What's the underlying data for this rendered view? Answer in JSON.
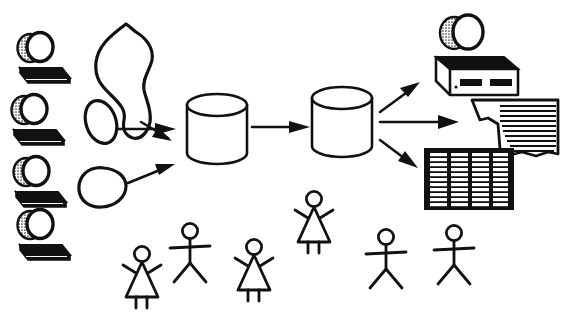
{
  "diagram": {
    "style": "hand-drawn black ink clipart on white",
    "colors": {
      "ink": "#111111",
      "paper": "#ffffff",
      "shade": "#5a5a5a"
    },
    "canvas": {
      "width": 564,
      "height": 315
    },
    "sources": [
      {
        "name": "workstation-1",
        "icon": "computer-icon",
        "x": 18,
        "y": 28
      },
      {
        "name": "workstation-2",
        "icon": "computer-icon",
        "x": 12,
        "y": 90
      },
      {
        "name": "workstation-3",
        "icon": "computer-icon",
        "x": 14,
        "y": 152
      },
      {
        "name": "workstation-4",
        "icon": "computer-icon",
        "x": 18,
        "y": 205
      }
    ],
    "blobs": [
      {
        "name": "blob-irregular",
        "shape": "irregular-cloud",
        "x": 95,
        "y": 30
      },
      {
        "name": "blob-ellipse",
        "shape": "tilted-ellipse",
        "x": 80,
        "y": 100
      },
      {
        "name": "blob-teardrop",
        "shape": "teardrop",
        "x": 82,
        "y": 160
      }
    ],
    "stores": [
      {
        "name": "database-cylinder-1",
        "icon": "cylinder-icon",
        "x": 185,
        "y": 95
      },
      {
        "name": "database-cylinder-2",
        "icon": "cylinder-icon",
        "x": 310,
        "y": 88
      }
    ],
    "outputs": [
      {
        "name": "printer-output",
        "icon": "printer-icon",
        "x": 430,
        "y": 15
      },
      {
        "name": "report-document-output",
        "icon": "document-icon",
        "x": 470,
        "y": 96
      },
      {
        "name": "spreadsheet-output",
        "icon": "spreadsheet-icon",
        "x": 424,
        "y": 148
      }
    ],
    "people": [
      {
        "name": "person-female-1",
        "icon": "stick-figure-female-icon",
        "x": 120,
        "y": 245
      },
      {
        "name": "person-male-1",
        "icon": "stick-figure-male-icon",
        "x": 168,
        "y": 222
      },
      {
        "name": "person-female-2",
        "icon": "stick-figure-female-icon",
        "x": 232,
        "y": 238
      },
      {
        "name": "person-female-3",
        "icon": "stick-figure-female-icon",
        "x": 292,
        "y": 190
      },
      {
        "name": "person-male-2",
        "icon": "stick-figure-male-icon",
        "x": 364,
        "y": 228
      },
      {
        "name": "person-male-3",
        "icon": "stick-figure-male-icon",
        "x": 432,
        "y": 224
      }
    ],
    "arrows": [
      {
        "name": "arrow-blob1-to-cylinder1",
        "from": "blob-irregular",
        "to": "database-cylinder-1"
      },
      {
        "name": "arrow-blob2-to-cylinder1",
        "from": "blob-ellipse",
        "to": "database-cylinder-1"
      },
      {
        "name": "arrow-blob3-to-cylinder1",
        "from": "blob-teardrop",
        "to": "database-cylinder-1"
      },
      {
        "name": "arrow-cylinder1-to-cylinder2",
        "from": "database-cylinder-1",
        "to": "database-cylinder-2"
      },
      {
        "name": "arrow-cylinder2-to-printer",
        "from": "database-cylinder-2",
        "to": "printer-output"
      },
      {
        "name": "arrow-cylinder2-to-document",
        "from": "database-cylinder-2",
        "to": "report-document-output"
      },
      {
        "name": "arrow-cylinder2-to-spreadsheet",
        "from": "database-cylinder-2",
        "to": "spreadsheet-output"
      }
    ],
    "spreadsheet": {
      "columns": 4,
      "rows": 11
    },
    "document": {
      "rule_lines": 12
    }
  }
}
